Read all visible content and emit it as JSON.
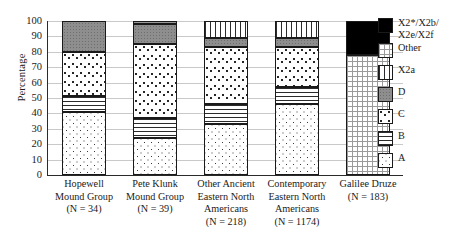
{
  "chart_data": {
    "type": "bar",
    "stacked": true,
    "title": "",
    "xlabel": "",
    "ylabel": "Percentage",
    "ylim": [
      0,
      100
    ],
    "yticks": [
      0,
      10,
      20,
      30,
      40,
      50,
      60,
      70,
      80,
      90,
      100
    ],
    "grid": true,
    "legend_position": "right",
    "categories": [
      "Hopewell Mound Group (N = 34)",
      "Pete Klunk Mound Group (N = 39)",
      "Other Ancient Eastern North Americans (N = 218)",
      "Contemporary Eastern North Americans (N = 1174)",
      "Galilee Druze (N = 183)"
    ],
    "series": [
      {
        "name": "A",
        "key": "A",
        "values": [
          41,
          24,
          33,
          46,
          0
        ]
      },
      {
        "name": "B",
        "key": "B",
        "values": [
          10,
          13,
          13,
          11,
          0
        ]
      },
      {
        "name": "C",
        "key": "C",
        "values": [
          29,
          48,
          37,
          26,
          0
        ]
      },
      {
        "name": "D",
        "key": "D",
        "values": [
          20,
          13,
          6,
          6,
          0
        ]
      },
      {
        "name": "X2a",
        "key": "X2a",
        "values": [
          0,
          0,
          11,
          11,
          0
        ]
      },
      {
        "name": "Other",
        "key": "Other",
        "values": [
          0,
          2,
          0,
          0,
          78
        ]
      },
      {
        "name": "X2*/X2b/X2e/X2f",
        "key": "X2star",
        "values": [
          0,
          0,
          0,
          0,
          22
        ]
      }
    ]
  },
  "axis": {
    "y_label": "Percentage",
    "y_ticks": [
      "100",
      "90",
      "80",
      "70",
      "60",
      "50",
      "40",
      "30",
      "20",
      "10",
      "0"
    ]
  },
  "x_categories": [
    {
      "lines": [
        "Hopewell",
        "Mound Group",
        "(N = 34)"
      ]
    },
    {
      "lines": [
        "Pete Klunk",
        "Mound Group",
        "(N = 39)"
      ]
    },
    {
      "lines": [
        "Other Ancient",
        "Eastern North",
        "Americans",
        "(N = 218)"
      ]
    },
    {
      "lines": [
        "Contemporary",
        "Eastern North",
        "Americans",
        "(N = 1174)"
      ]
    },
    {
      "lines": [
        "Galilee Druze",
        "(N = 183)"
      ]
    }
  ],
  "legend": {
    "items": [
      {
        "key": "X2star",
        "lines": [
          "X2*/X2b/",
          "X2e/X2f"
        ]
      },
      {
        "key": "Other",
        "lines": [
          "Other"
        ]
      },
      {
        "key": "X2a",
        "lines": [
          "X2a"
        ]
      },
      {
        "key": "D",
        "lines": [
          "D"
        ]
      },
      {
        "key": "C",
        "lines": [
          "C"
        ]
      },
      {
        "key": "B",
        "lines": [
          "B"
        ]
      },
      {
        "key": "A",
        "lines": [
          "A"
        ]
      }
    ]
  },
  "colors": {
    "black": "#000000",
    "gray_D": "#8e8e8e",
    "white": "#ffffff",
    "outline": "#1a1a1a",
    "gridline": "#c9c9c9"
  }
}
